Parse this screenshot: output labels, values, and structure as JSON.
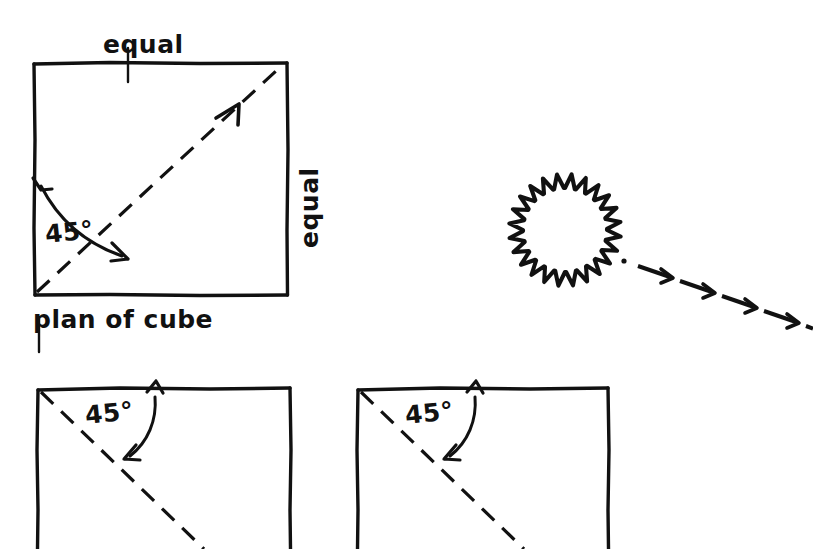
{
  "canvas": {
    "width": 813,
    "height": 549,
    "background": "#ffffff",
    "ink": "#111111",
    "style": "hand-drawn technical sketch"
  },
  "labels": {
    "equal_top": "equal",
    "equal_right": "equal",
    "angle_main": "45°",
    "plan_caption": "plan of cube",
    "angle_bottom_left": "45°",
    "angle_bottom_right": "45°"
  },
  "figures": [
    {
      "name": "plan-of-cube-square",
      "kind": "square",
      "caption": "plan of cube",
      "x": 34,
      "y": 63,
      "width": 253,
      "height": 232,
      "diagonal": {
        "from": "bottom-left",
        "to": "top-right",
        "style": "dashed",
        "arrowhead": "open-chevron"
      },
      "angle": {
        "value": "45°",
        "between": [
          "left-edge",
          "diagonal"
        ],
        "vertex": "bottom-left",
        "arc_arrows": "double"
      },
      "edge_labels": {
        "top": "equal",
        "right": "equal"
      }
    },
    {
      "name": "elevation-square-left",
      "kind": "square",
      "x": 38,
      "y": 388,
      "width": 252,
      "height": 232,
      "clipped_bottom": true,
      "diagonal": {
        "from": "top-left",
        "to": "bottom-right",
        "style": "dashed",
        "arrowhead": "none"
      },
      "angle": {
        "value": "45°",
        "between": [
          "top-edge",
          "diagonal"
        ],
        "vertex": "top-left",
        "arc_arrows": "double"
      }
    },
    {
      "name": "elevation-square-right",
      "kind": "square",
      "x": 358,
      "y": 388,
      "width": 250,
      "height": 232,
      "clipped_bottom": true,
      "diagonal": {
        "from": "top-left",
        "to": "bottom-right",
        "style": "dashed",
        "arrowhead": "none"
      },
      "angle": {
        "value": "45°",
        "between": [
          "top-edge",
          "diagonal"
        ],
        "vertex": "top-left",
        "arc_arrows": "double"
      }
    },
    {
      "name": "sun-symbol",
      "kind": "sun",
      "center_x": 565,
      "center_y": 230,
      "radius": 42,
      "ray_count": 24,
      "ray_style": "zigzag-flame",
      "meaning": "sun / light source"
    },
    {
      "name": "sun-ray-arrows",
      "kind": "dashed-arrow-trail",
      "from_x": 622,
      "from_y": 262,
      "to_x": 813,
      "to_y": 330,
      "segments": 5,
      "arrowheads": 5,
      "meaning": "direction of sunlight"
    }
  ],
  "icons": {
    "sun": "sun-icon",
    "arrow": "arrow-icon",
    "angle_arc": "angle-arc-icon"
  }
}
